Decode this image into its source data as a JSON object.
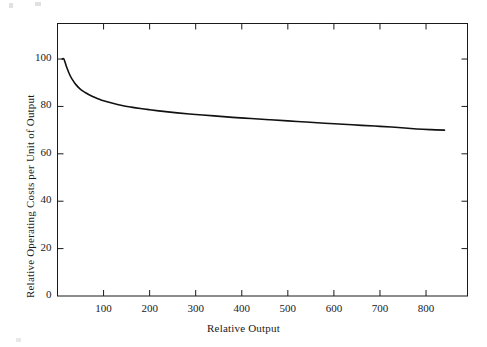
{
  "figure": {
    "background_color": "#ffffff",
    "ink_color": "#1a1a1a"
  },
  "chart_data": {
    "type": "line",
    "title": "",
    "subtitle": "",
    "xlabel": "Relative Output",
    "ylabel": "Relative Operating Costs per Unit of Output",
    "xlim": [
      0,
      890
    ],
    "ylim": [
      0,
      115
    ],
    "grid": false,
    "legend": null,
    "legend_position": "none",
    "x_ticks": [
      100,
      200,
      300,
      400,
      500,
      600,
      700,
      800
    ],
    "x_tick_labels": [
      "100",
      "200",
      "300",
      "400",
      "500",
      "600",
      "700",
      "800"
    ],
    "y_ticks": [
      0,
      20,
      40,
      60,
      80,
      100
    ],
    "y_tick_labels": [
      "0",
      "20",
      "40",
      "60",
      "80",
      "100"
    ],
    "series": [
      {
        "name": "Relative operating cost per unit of output",
        "color": "#111111",
        "line_width": 1.6,
        "x": [
          10,
          14,
          20,
          26,
          32,
          40,
          50,
          60,
          75,
          90,
          100,
          120,
          140,
          160,
          180,
          200,
          230,
          260,
          300,
          340,
          380,
          420,
          460,
          500,
          540,
          580,
          620,
          660,
          700,
          740,
          780,
          810,
          840
        ],
        "y": [
          100,
          100,
          96.5,
          93.6,
          91.4,
          89.2,
          87.2,
          85.9,
          84.3,
          83.1,
          82.4,
          81.3,
          80.4,
          79.7,
          79.1,
          78.6,
          77.9,
          77.3,
          76.6,
          76.0,
          75.4,
          74.9,
          74.4,
          73.9,
          73.4,
          72.9,
          72.5,
          72.0,
          71.6,
          71.1,
          70.5,
          70.2,
          70.0
        ]
      }
    ],
    "annotations": []
  }
}
